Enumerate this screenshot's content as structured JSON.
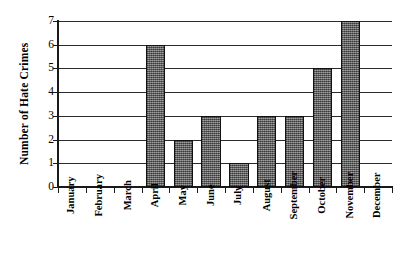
{
  "chart_data": {
    "type": "bar",
    "title": "",
    "subtitle": "",
    "xlabel": "",
    "ylabel": "Number of Hate Crimes",
    "categories": [
      "January",
      "February",
      "March",
      "April",
      "May",
      "June",
      "July",
      "August",
      "September",
      "October",
      "November",
      "December"
    ],
    "values": [
      0,
      0,
      0,
      6,
      2,
      3,
      1,
      3,
      3,
      5,
      7,
      0
    ],
    "series": [
      {
        "name": "Number of Hate Crimes",
        "values": [
          0,
          0,
          0,
          6,
          2,
          3,
          1,
          3,
          3,
          5,
          7,
          0
        ]
      }
    ],
    "ylim": [
      0,
      7
    ],
    "y_ticks": [
      0,
      1,
      2,
      3,
      4,
      5,
      6,
      7
    ],
    "y_tick_labels": [
      "0",
      "1",
      "2",
      "3",
      "4",
      "5",
      "6",
      "7"
    ],
    "grid": true,
    "grid_axis": "y",
    "legend": false,
    "legend_position": "none",
    "bar_fill_color": "#6e6e6e",
    "bar_edge_color": "#111111",
    "axis_color": "#1a1a1a",
    "background_color": "#ffffff",
    "text_color": "#000000",
    "x_tick_label_rotation": 90,
    "y_axis_label_rotation": 90
  }
}
